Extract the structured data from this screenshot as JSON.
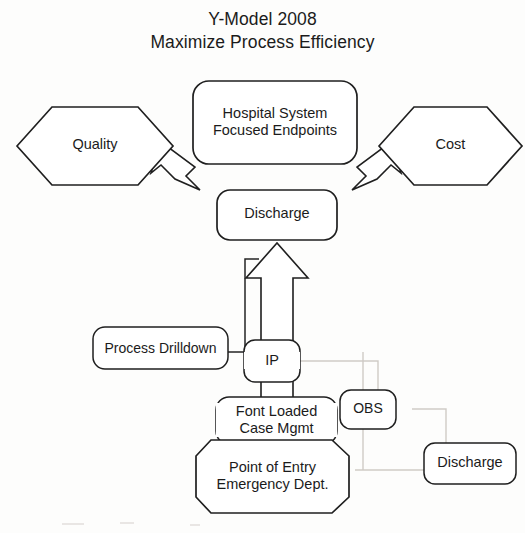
{
  "diagram": {
    "title": {
      "line1": "Y-Model 2008",
      "line2": "Maximize Process Efficiency"
    },
    "nodes": {
      "hospital_system": {
        "label": "Hospital System\nFocused Endpoints",
        "shape": "rounded-rectangle"
      },
      "quality": {
        "label": "Quality",
        "shape": "hexagon"
      },
      "cost": {
        "label": "Cost",
        "shape": "hexagon"
      },
      "discharge_top": {
        "label": "Discharge",
        "shape": "rounded-rectangle"
      },
      "process_drilldown": {
        "label": "Process Drilldown",
        "shape": "rounded-rectangle"
      },
      "ip": {
        "label": "IP",
        "shape": "rounded-rectangle"
      },
      "font_loaded_case_mgmt": {
        "label": "Font Loaded\nCase Mgmt",
        "shape": "rounded-rectangle"
      },
      "obs": {
        "label": "OBS",
        "shape": "rounded-rectangle"
      },
      "discharge_lower_right": {
        "label": "Discharge",
        "shape": "rounded-rectangle"
      },
      "point_of_entry": {
        "label": "Point of Entry\nEmergency Dept.",
        "shape": "octagon"
      }
    },
    "connectors": [
      {
        "name": "endpoints-to-quality",
        "style": "block-arrow",
        "from": "hospital_system",
        "to": "quality"
      },
      {
        "name": "endpoints-to-cost",
        "style": "block-arrow",
        "from": "hospital_system",
        "to": "cost"
      },
      {
        "name": "case-mgmt-through-ip-to-discharge",
        "style": "block-arrow",
        "from": "font_loaded_case_mgmt",
        "to": "discharge_top"
      },
      {
        "name": "process-drilldown-bracket",
        "style": "thin-line",
        "from": "process_drilldown",
        "to": "discharge_top"
      },
      {
        "name": "ip-to-obs",
        "style": "faint-line",
        "from": "ip",
        "to": "obs"
      },
      {
        "name": "obs-to-discharge",
        "style": "faint-line",
        "from": "obs",
        "to": "discharge_lower_right"
      },
      {
        "name": "point-of-entry-to-discharge",
        "style": "faint-line",
        "from": "point_of_entry",
        "to": "discharge_lower_right"
      }
    ],
    "colors": {
      "stroke": "#1f1f1f",
      "faint_stroke": "#cfcbc6",
      "fill": "#ffffff",
      "text": "#1b1b1b",
      "background": "#fdfdfc"
    }
  }
}
